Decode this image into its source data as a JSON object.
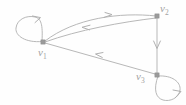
{
  "figure": {
    "background_color": "#fefefe",
    "stroke_color": "#b8b8b8",
    "node_color": "#9a9a9a",
    "label_color": "#a2a2a2",
    "width": 186,
    "height": 105
  },
  "nodes": [
    {
      "id": "v1",
      "label_base": "v",
      "label_sub": "1",
      "x": 43,
      "y": 42,
      "label_x": 38,
      "label_y": 56
    },
    {
      "id": "v2",
      "label_base": "v",
      "label_sub": "2",
      "x": 157,
      "y": 16,
      "label_x": 160,
      "label_y": 12
    },
    {
      "id": "v3",
      "label_base": "v",
      "label_sub": "3",
      "x": 157,
      "y": 75,
      "label_x": 136,
      "label_y": 80
    }
  ],
  "edges": [
    {
      "id": "v1-to-v2",
      "from": "v1",
      "to": "v2",
      "kind": "curve",
      "direction": "right",
      "path": "M 45 41 C 75 18, 120 12, 156 16",
      "arrow": "M 105 12.5 L 112 14.6 L 104.2 17.4"
    },
    {
      "id": "v2-to-v1",
      "from": "v2",
      "to": "v1",
      "kind": "curve",
      "direction": "left",
      "path": "M 156 18 C 122 22, 78 30, 45 42",
      "arrow": "M 90 25.2 L 82 27.3 L 89.6 29.9"
    },
    {
      "id": "v2-to-v3",
      "from": "v2",
      "to": "v3",
      "kind": "line",
      "direction": "down",
      "path": "M 157 18 L 157 74",
      "arrow": "M 153.6 41 L 157 48.5 L 160.4 41"
    },
    {
      "id": "v3-to-v1",
      "from": "v3",
      "to": "v1",
      "kind": "line",
      "direction": "left",
      "path": "M 155 74 L 45 43",
      "arrow": "M 103 52.5 L 95.5 54 L 102.3 57.5"
    },
    {
      "id": "v1-self-loop",
      "from": "v1",
      "to": "v1",
      "kind": "self-loop",
      "direction": "clockwise",
      "path": "M 42 41.5 C 26 43, 15 36, 16 28 C 17 19, 27 15, 35 17 C 41 18.5, 43 24, 42 41.5",
      "arrow": "M 32.5 16 L 40.5 17.6 L 35 22.6"
    },
    {
      "id": "v3-self-loop",
      "from": "v3",
      "to": "v3",
      "kind": "self-loop",
      "direction": "clockwise",
      "path": "M 158 76 C 172 75, 181 82, 180 90 C 179 98, 170 102, 163 100 C 156 98, 153 90, 158 76",
      "arrow": "M 173 90 L 181 91.5 L 175.5 97.5"
    }
  ]
}
